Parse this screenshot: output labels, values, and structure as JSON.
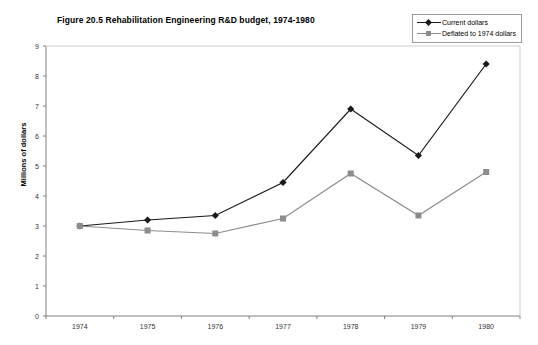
{
  "chart_data": {
    "type": "line",
    "title": "Figure 20.5 Rehabilitation Engineering R&D budget, 1974-1980",
    "xlabel": "",
    "ylabel": "Millions of dollars",
    "categories": [
      "1974",
      "1975",
      "1976",
      "1977",
      "1978",
      "1979",
      "1980"
    ],
    "series": [
      {
        "name": "Current dollars",
        "marker": "diamond",
        "color": "#1a1a1a",
        "values": [
          3.0,
          3.2,
          3.35,
          4.45,
          6.9,
          5.35,
          8.4
        ]
      },
      {
        "name": "Deflated to 1974 dollars",
        "marker": "square",
        "color": "#8c8c8c",
        "values": [
          3.0,
          2.85,
          2.75,
          3.25,
          4.75,
          3.35,
          4.8
        ]
      }
    ],
    "ylim": [
      0,
      9
    ],
    "yticks": [
      0,
      1,
      2,
      3,
      4,
      5,
      6,
      7,
      8,
      9
    ],
    "ytick_labels": [
      "0",
      "1",
      "2",
      "3",
      "4",
      "5",
      "6",
      "7",
      "8",
      "9"
    ],
    "grid": false,
    "legend_position": "top-right",
    "axis_color": "#808080",
    "background": "#ffffff"
  },
  "legend": {
    "items": [
      {
        "label": "Current dollars"
      },
      {
        "label": "Deflated to 1974 dollars"
      }
    ]
  }
}
